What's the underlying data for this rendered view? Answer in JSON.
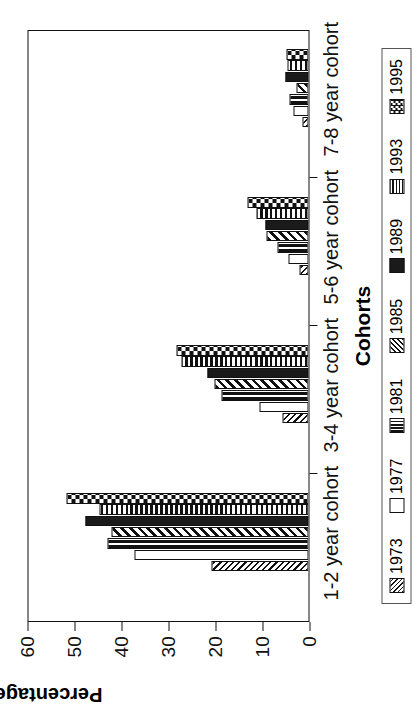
{
  "chart_data": {
    "type": "bar",
    "title": "",
    "orientation": "vertical-grouped",
    "xlabel": "Cohorts",
    "ylabel": "Percentage",
    "ylim": [
      0,
      60
    ],
    "yticks": [
      0,
      10,
      20,
      30,
      40,
      50,
      60
    ],
    "grid": false,
    "legend_position": "bottom",
    "categories": [
      "1-2 year cohort",
      "3-4 year cohort",
      "5-6 year cohort",
      "7-8 year cohort"
    ],
    "series": [
      {
        "name": "1973",
        "pattern": "diagonal-hatch-fine",
        "values": [
          20.6,
          5.5,
          2.0,
          1.3
        ]
      },
      {
        "name": "1977",
        "pattern": "empty-white",
        "values": [
          37.0,
          10.5,
          4.3,
          3.2
        ]
      },
      {
        "name": "1981",
        "pattern": "vertical-bars",
        "values": [
          42.8,
          18.5,
          6.5,
          4.0
        ]
      },
      {
        "name": "1985",
        "pattern": "diagonal-hatch",
        "values": [
          42.0,
          20.0,
          9.0,
          2.6
        ]
      },
      {
        "name": "1989",
        "pattern": "solid-black",
        "values": [
          47.5,
          21.5,
          9.2,
          4.9
        ]
      },
      {
        "name": "1993",
        "pattern": "horizontal-lines",
        "values": [
          44.5,
          27.0,
          11.0,
          4.5
        ]
      },
      {
        "name": "1995",
        "pattern": "checkerboard",
        "values": [
          51.5,
          28.0,
          13.0,
          4.7
        ]
      }
    ]
  },
  "axes": {
    "y_title": "Percentage",
    "x_title": "Cohorts",
    "y_tick_labels": [
      "0",
      "10",
      "20",
      "30",
      "40",
      "50",
      "60"
    ],
    "x_tick_labels": [
      "1-2 year cohort",
      "3-4 year cohort",
      "5-6 year cohort",
      "7-8 year cohort"
    ]
  },
  "legend": {
    "entries": [
      {
        "label": "1973"
      },
      {
        "label": "1977"
      },
      {
        "label": "1981"
      },
      {
        "label": "1985"
      },
      {
        "label": "1989"
      },
      {
        "label": "1993"
      },
      {
        "label": "1995"
      }
    ]
  },
  "colors": {
    "ink": "#111111",
    "paper": "#ffffff",
    "solid_series": "#1a1a1a"
  }
}
